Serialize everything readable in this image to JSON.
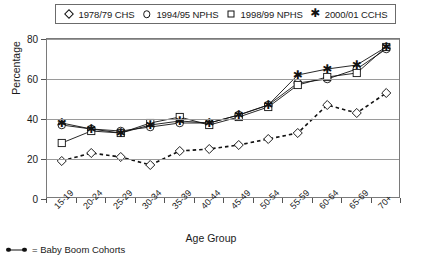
{
  "chart_data": {
    "type": "line",
    "title": "",
    "xlabel": "Age Group",
    "ylabel": "Percentage",
    "ylim": [
      0,
      80
    ],
    "yticks": [
      0,
      20,
      40,
      60,
      80
    ],
    "grid": true,
    "legend_position": "top",
    "categories": [
      "15-19",
      "20-24",
      "25-29",
      "30-34",
      "35-39",
      "40-44",
      "45-49",
      "50-54",
      "55-59",
      "60-64",
      "65-69",
      "70+"
    ],
    "series": [
      {
        "name": "1978/79 CHS",
        "marker": "diamond",
        "line": "dashed",
        "values": [
          19,
          23,
          21,
          17,
          24,
          25,
          27,
          30,
          33,
          47,
          43,
          53
        ]
      },
      {
        "name": "1994/95 NPHS",
        "marker": "circle",
        "line": "solid",
        "values": [
          37,
          35,
          34,
          36,
          38,
          38,
          42,
          47,
          58,
          60,
          65,
          75
        ]
      },
      {
        "name": "1998/99 NPHS",
        "marker": "square",
        "line": "solid",
        "values": [
          28,
          34,
          33,
          38,
          41,
          37,
          41,
          46,
          57,
          61,
          63,
          76
        ]
      },
      {
        "name": "2000/01 CCHS",
        "marker": "asterisk",
        "line": "solid",
        "values": [
          38,
          35,
          33,
          37,
          39,
          38,
          42,
          47,
          62,
          65,
          67,
          76
        ]
      }
    ],
    "footnote": "= Baby Boom Cohorts",
    "footnote_marker": "baby-boom-line"
  },
  "legend": {
    "items": [
      {
        "marker": "diamond",
        "label": "1978/79 CHS"
      },
      {
        "marker": "circle",
        "label": "1994/95 NPHS"
      },
      {
        "marker": "square",
        "label": "1998/99 NPHS"
      },
      {
        "marker": "asterisk",
        "label": "2000/01 CCHS"
      }
    ]
  },
  "colors": {
    "ink": "#111111",
    "grid": "#9a9a9a",
    "frame": "#7a7a7a",
    "background": "#ffffff"
  }
}
